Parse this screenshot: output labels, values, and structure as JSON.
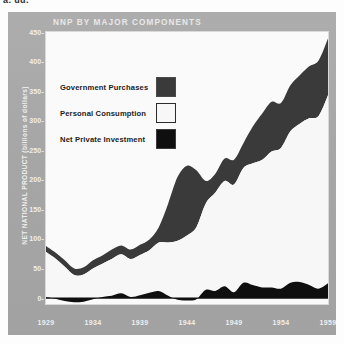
{
  "figure": {
    "cropped_top_fragment": "a. uu.",
    "title": "NNP BY MAJOR COMPONENTS",
    "card_color": "#a9a9a9",
    "plot_bg_color": "#fafafa"
  },
  "legend": {
    "position": "upper-left-inside",
    "items": [
      {
        "label": "Government Purchases",
        "color": "#3a3a3a",
        "swatch": "gov-swatch"
      },
      {
        "label": "Personal Consumption",
        "color": "#f7f7f7",
        "swatch": "consumption-swatch"
      },
      {
        "label": "Net Private Investment",
        "color": "#0f0f0f",
        "swatch": "investment-swatch"
      }
    ]
  },
  "axes": {
    "y_title": "NET NATIONAL PRODUCT (billions of dollars)",
    "y_ticks": [
      "450",
      "400",
      "350",
      "300",
      "250",
      "200",
      "150",
      "100",
      "50",
      "0"
    ],
    "x_ticks": [
      "1929",
      "1934",
      "1939",
      "1944",
      "1949",
      "1954",
      "1959"
    ]
  },
  "chart_data": {
    "type": "area",
    "stacked": true,
    "title": "NNP BY MAJOR COMPONENTS",
    "xlabel": "",
    "ylabel": "NET NATIONAL PRODUCT (billions of dollars)",
    "xlim": [
      1929,
      1959
    ],
    "ylim": [
      -10,
      450
    ],
    "ytick_values": [
      0,
      50,
      100,
      150,
      200,
      250,
      300,
      350,
      400,
      450
    ],
    "xtick_values": [
      1929,
      1934,
      1939,
      1944,
      1949,
      1954,
      1959
    ],
    "grid": false,
    "legend_position": "upper left",
    "x": [
      1929,
      1930,
      1931,
      1932,
      1933,
      1934,
      1935,
      1936,
      1937,
      1938,
      1939,
      1940,
      1941,
      1942,
      1943,
      1944,
      1945,
      1946,
      1947,
      1948,
      1949,
      1950,
      1951,
      1952,
      1953,
      1954,
      1955,
      1956,
      1957,
      1958,
      1959
    ],
    "series": [
      {
        "name": "Net Private Investment",
        "color": "#0f0f0f",
        "stack_order": 1,
        "values": [
          2,
          -1,
          -5,
          -7,
          -6,
          -2,
          2,
          4,
          8,
          2,
          5,
          9,
          12,
          4,
          -3,
          -4,
          -2,
          14,
          12,
          20,
          10,
          26,
          22,
          18,
          18,
          16,
          26,
          27,
          22,
          16,
          25
        ]
      },
      {
        "name": "Personal Consumption",
        "color": "#f7f7f7",
        "stack_order": 2,
        "values": [
          76,
          68,
          58,
          46,
          46,
          52,
          56,
          62,
          66,
          64,
          68,
          72,
          82,
          90,
          100,
          110,
          122,
          146,
          166,
          178,
          182,
          194,
          206,
          216,
          230,
          238,
          256,
          268,
          282,
          292,
          318
        ]
      },
      {
        "name": "Government Purchases",
        "color": "#3a3a3a",
        "stack_order": 3,
        "values": [
          10,
          10,
          11,
          11,
          12,
          14,
          14,
          16,
          15,
          16,
          17,
          18,
          26,
          66,
          108,
          118,
          96,
          38,
          32,
          38,
          42,
          42,
          62,
          78,
          84,
          76,
          78,
          82,
          88,
          94,
          96
        ]
      }
    ],
    "totals_note": "Top boundary of stack equals Net National Product; rises from about 88 in 1929 to about 440 in 1959.",
    "stack_totals": [
      88,
      77,
      64,
      50,
      52,
      64,
      72,
      82,
      89,
      82,
      90,
      99,
      120,
      160,
      205,
      224,
      216,
      198,
      210,
      236,
      234,
      262,
      290,
      312,
      332,
      330,
      360,
      377,
      392,
      402,
      439
    ]
  }
}
